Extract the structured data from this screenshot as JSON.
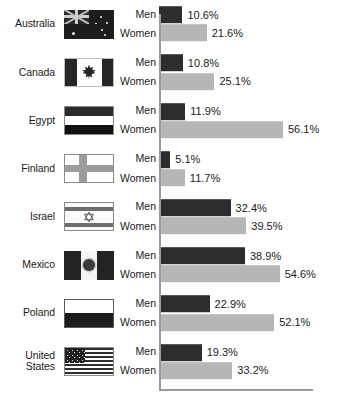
{
  "chart_data": {
    "type": "bar",
    "title": "",
    "xlabel": "",
    "ylabel": "",
    "orientation": "horizontal",
    "grid": false,
    "legend_position": "none",
    "axis_min": 0,
    "axis_max": 70,
    "value_suffix": "%",
    "categories": [
      "Australia",
      "Canada",
      "Egypt",
      "Finland",
      "Israel",
      "Mexico",
      "Poland",
      "United States"
    ],
    "series": [
      {
        "name": "Men",
        "color": "#2d2d2d",
        "values": [
          10.6,
          10.8,
          11.9,
          5.1,
          32.4,
          38.9,
          22.9,
          19.3
        ]
      },
      {
        "name": "Women",
        "color": "#b6b6b6",
        "values": [
          21.6,
          25.1,
          56.1,
          11.7,
          39.5,
          54.6,
          52.1,
          33.2
        ]
      }
    ]
  },
  "rows": [
    {
      "country_lines": [
        "Australia"
      ],
      "flag": "flag-australia",
      "men": {
        "label": "Men",
        "value": 10.6,
        "value_label": "10.6%"
      },
      "women": {
        "label": "Women",
        "value": 21.6,
        "value_label": "21.6%"
      }
    },
    {
      "country_lines": [
        "Canada"
      ],
      "flag": "flag-canada",
      "men": {
        "label": "Men",
        "value": 10.8,
        "value_label": "10.8%"
      },
      "women": {
        "label": "Women",
        "value": 25.1,
        "value_label": "25.1%"
      }
    },
    {
      "country_lines": [
        "Egypt"
      ],
      "flag": "flag-egypt",
      "men": {
        "label": "Men",
        "value": 11.9,
        "value_label": "11.9%"
      },
      "women": {
        "label": "Women",
        "value": 56.1,
        "value_label": "56.1%"
      }
    },
    {
      "country_lines": [
        "Finland"
      ],
      "flag": "flag-finland",
      "men": {
        "label": "Men",
        "value": 5.1,
        "value_label": "5.1%"
      },
      "women": {
        "label": "Women",
        "value": 11.7,
        "value_label": "11.7%"
      }
    },
    {
      "country_lines": [
        "Israel"
      ],
      "flag": "flag-israel",
      "men": {
        "label": "Men",
        "value": 32.4,
        "value_label": "32.4%"
      },
      "women": {
        "label": "Women",
        "value": 39.5,
        "value_label": "39.5%"
      }
    },
    {
      "country_lines": [
        "Mexico"
      ],
      "flag": "flag-mexico",
      "men": {
        "label": "Men",
        "value": 38.9,
        "value_label": "38.9%"
      },
      "women": {
        "label": "Women",
        "value": 54.6,
        "value_label": "54.6%"
      }
    },
    {
      "country_lines": [
        "Poland"
      ],
      "flag": "flag-poland",
      "men": {
        "label": "Men",
        "value": 22.9,
        "value_label": "22.9%"
      },
      "women": {
        "label": "Women",
        "value": 52.1,
        "value_label": "52.1%"
      }
    },
    {
      "country_lines": [
        "United",
        "States"
      ],
      "flag": "flag-us",
      "men": {
        "label": "Men",
        "value": 19.3,
        "value_label": "19.3%"
      },
      "women": {
        "label": "Women",
        "value": 33.2,
        "value_label": "33.2%"
      }
    }
  ],
  "style": {
    "men_color": "#2d2d2d",
    "women_color": "#b6b6b6",
    "axis_color": "#9a9a9a",
    "background": "#ffffff",
    "px_per_percent": 2.21
  }
}
